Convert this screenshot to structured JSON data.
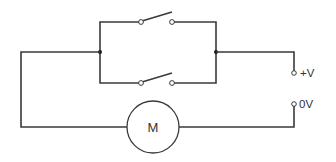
{
  "diagram": {
    "type": "circuit-schematic",
    "title": "",
    "components": {
      "motor": {
        "label": "M"
      },
      "switch_top": {
        "type": "switch",
        "state": "open"
      },
      "switch_bottom": {
        "type": "switch",
        "state": "open"
      },
      "terminal_positive": {
        "label": "+V"
      },
      "terminal_ground": {
        "label": "0V"
      }
    }
  }
}
